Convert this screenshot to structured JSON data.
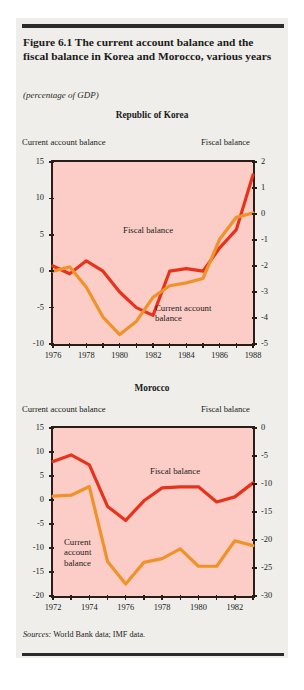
{
  "figure": {
    "title": "Figure 6.1  The current account balance and the fiscal balance in Korea and Morocco, various years",
    "subtitle": "(percentage of GDP)",
    "source_prefix": "Sources:",
    "source_text": "World Bank data; IMF data.",
    "colors": {
      "plot_fill": "#fbcdc6",
      "fiscal_balance": "#e8331c",
      "current_account_balance": "#f0922a",
      "frame": "#2a1d18",
      "panel_bg": "#efeeea",
      "rule": "#2b2b2b"
    }
  },
  "chart_data": [
    {
      "type": "line",
      "title": "Republic of Korea",
      "xlabel": "",
      "left_axis_label": "Current account balance",
      "right_axis_label": "Fiscal balance",
      "ylabel": "percentage of GDP",
      "grid": false,
      "legend": "inline annotations",
      "x": [
        1976,
        1977,
        1978,
        1979,
        1980,
        1981,
        1982,
        1983,
        1984,
        1985,
        1986,
        1987,
        1988
      ],
      "xlim": [
        1976,
        1988
      ],
      "xticks": [
        1976,
        1978,
        1980,
        1982,
        1984,
        1986,
        1988
      ],
      "xticklabels": [
        "1976",
        "1978",
        "1980",
        "1982",
        "1984",
        "1986",
        "1988"
      ],
      "left_ylim": [
        -10,
        15
      ],
      "left_yticks": [
        -10,
        -5,
        0,
        5,
        10,
        15
      ],
      "left_yticklabels": [
        "-10",
        "-5",
        "0",
        "5",
        "10",
        "15"
      ],
      "right_ylim": [
        -5,
        2
      ],
      "right_yticks": [
        -5,
        -4,
        -3,
        -2,
        -1,
        0,
        1,
        2
      ],
      "right_yticklabels": [
        "-5",
        "-4",
        "-3",
        "-2",
        "-1",
        "0",
        "1",
        "2"
      ],
      "series": [
        {
          "name": "Fiscal balance",
          "axis": "right",
          "color": "#e8331c",
          "values": [
            -2.0,
            -2.3,
            -1.8,
            -2.2,
            -3.0,
            -3.6,
            -3.9,
            -2.2,
            -2.1,
            -2.2,
            -1.3,
            -0.6,
            1.5
          ]
        },
        {
          "name": "Current account balance",
          "axis": "left",
          "color": "#f0922a",
          "values": [
            0.0,
            0.6,
            -2.2,
            -6.3,
            -8.7,
            -6.9,
            -3.6,
            -2.0,
            -1.6,
            -1.0,
            4.4,
            7.4,
            8.0
          ]
        }
      ],
      "annotations": [
        {
          "text": "Fiscal balance",
          "x": 1981,
          "series": "fiscal"
        },
        {
          "text": "Current account\nbalance",
          "x": 1983.5,
          "series": "current"
        }
      ]
    },
    {
      "type": "line",
      "title": "Morocco",
      "xlabel": "",
      "left_axis_label": "Current account balance",
      "right_axis_label": "Fiscal balance",
      "ylabel": "percentage of GDP",
      "grid": false,
      "legend": "inline annotations",
      "x": [
        1972,
        1973,
        1974,
        1975,
        1976,
        1977,
        1978,
        1979,
        1980,
        1981,
        1982,
        1983
      ],
      "xlim": [
        1972,
        1983
      ],
      "xticks": [
        1972,
        1974,
        1976,
        1978,
        1980,
        1982
      ],
      "xticklabels": [
        "1972",
        "1974",
        "1976",
        "1978",
        "1980",
        "1982"
      ],
      "left_ylim": [
        -20,
        15
      ],
      "left_yticks": [
        -20,
        -15,
        -10,
        -5,
        0,
        5,
        10,
        15
      ],
      "left_yticklabels": [
        "-20",
        "-15",
        "-10",
        "-5",
        "0",
        "5",
        "10",
        "15"
      ],
      "right_ylim": [
        -30,
        0
      ],
      "right_yticks": [
        -30,
        -25,
        -20,
        -15,
        -10,
        -5,
        0
      ],
      "right_yticklabels": [
        "-30",
        "-25",
        "-20",
        "-15",
        "-10",
        "-5",
        "0"
      ],
      "series": [
        {
          "name": "Fiscal balance",
          "axis": "right",
          "color": "#e8331c",
          "values": [
            -6.0,
            -4.8,
            -6.6,
            -14.0,
            -16.5,
            -13.0,
            -10.7,
            -10.5,
            -10.5,
            -13.2,
            -12.3,
            -9.8
          ]
        },
        {
          "name": "Current account balance",
          "axis": "left",
          "color": "#f0922a",
          "values": [
            0.8,
            1.0,
            2.8,
            -12.8,
            -17.5,
            -13.0,
            -12.2,
            -10.2,
            -13.8,
            -13.8,
            -8.5,
            -9.5
          ]
        }
      ],
      "annotations": [
        {
          "text": "Fiscal balance",
          "x": 1977,
          "series": "fiscal"
        },
        {
          "text": "Current\naccount\nbalance",
          "x": 1973,
          "series": "current"
        }
      ]
    }
  ]
}
